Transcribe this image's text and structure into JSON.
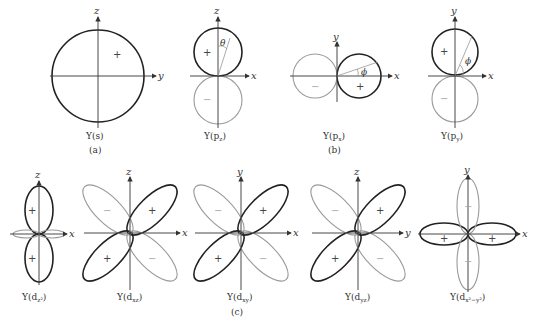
{
  "figure": {
    "panels": {
      "a": {
        "label": "(a)",
        "plots": [
          {
            "id": "s",
            "caption": "Y(s)",
            "axes": [
              "z",
              "y"
            ],
            "lobes": [
              {
                "sign": "+",
                "shape": "sphere"
              }
            ]
          }
        ]
      },
      "b": {
        "label": "(b)",
        "plots": [
          {
            "id": "pz",
            "caption": "Y(pz)",
            "axes": [
              "z",
              "x"
            ],
            "angle": "θ",
            "lobes": [
              {
                "sign": "+",
                "dir": "+z"
              },
              {
                "sign": "−",
                "dir": "−z"
              }
            ]
          },
          {
            "id": "px",
            "caption": "Y(px)",
            "axes": [
              "y",
              "x"
            ],
            "angle": "ϕ",
            "lobes": [
              {
                "sign": "+",
                "dir": "+x"
              },
              {
                "sign": "−",
                "dir": "−x"
              }
            ]
          },
          {
            "id": "py",
            "caption": "Y(py)",
            "axes": [
              "y",
              "x"
            ],
            "angle": "ϕ",
            "lobes": [
              {
                "sign": "+",
                "dir": "+y"
              },
              {
                "sign": "−",
                "dir": "−y"
              }
            ]
          }
        ]
      },
      "c": {
        "label": "(c)",
        "plots": [
          {
            "id": "dz2",
            "caption": "Y(dz²)",
            "axes": [
              "z",
              "x"
            ],
            "lobes": [
              "+",
              "+"
            ]
          },
          {
            "id": "dxz",
            "caption": "Y(dxz)",
            "axes": [
              "z",
              "x"
            ],
            "lobes": [
              "+",
              "−",
              "+",
              "−"
            ]
          },
          {
            "id": "dxy",
            "caption": "Y(dxy)",
            "axes": [
              "y",
              "x"
            ],
            "lobes": [
              "+",
              "−",
              "+",
              "−"
            ]
          },
          {
            "id": "dyz",
            "caption": "Y(dyz)",
            "axes": [
              "z",
              "y"
            ],
            "lobes": [
              "+",
              "−",
              "+",
              "−"
            ]
          },
          {
            "id": "dx2y2",
            "caption": "Y(dx²−y²)",
            "axes": [
              "y",
              "x"
            ],
            "lobes": [
              "+",
              "−",
              "+",
              "−"
            ]
          }
        ]
      }
    },
    "text": {
      "z": "z",
      "y": "y",
      "x": "x",
      "theta": "θ",
      "phi": "ϕ",
      "plus": "+",
      "minus": "−",
      "cap_s": "Y(s)",
      "cap_pz": "Y(p",
      "cap_px": "Y(p",
      "cap_py": "Y(p",
      "cap_dz2": "Y(d",
      "cap_dxz": "Y(d",
      "cap_dxy": "Y(d",
      "cap_dyz": "Y(d",
      "cap_dx2y2": "Y(d",
      "sub_pz": "z",
      "sub_px": "x",
      "sub_py": "y",
      "sub_dz2": "z²",
      "sub_dxz": "xz",
      "sub_dxy": "xy",
      "sub_dyz": "yz",
      "sub_dx2y2": "x²−y²",
      "close": ")",
      "panel_a": "(a)",
      "panel_b": "(b)",
      "panel_c": "(c)"
    }
  }
}
